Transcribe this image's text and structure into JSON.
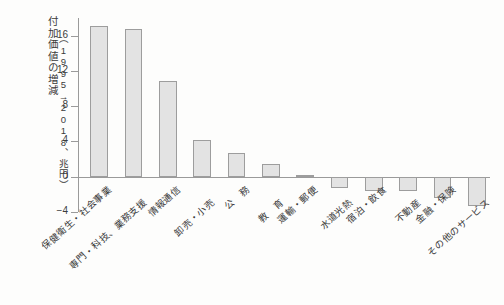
{
  "chart_data": {
    "type": "bar",
    "title": "",
    "subtitle": "",
    "xlabel": "",
    "ylabel": "付加価値の増減",
    "ylabel_sub": "（1995→2018、兆円）",
    "categories": [
      "保健衛生・社会事業",
      "専門・科技、業務支援",
      "情報通信",
      "卸売・小売",
      "公　務",
      "教　育",
      "運輸・郵便",
      "水道光熱",
      "宿泊・飲食",
      "不動産",
      "金融・保険",
      "その他のサービス"
    ],
    "values": [
      17.1,
      16.8,
      10.8,
      4.2,
      2.7,
      1.4,
      0.2,
      -1.3,
      -1.6,
      -1.6,
      -2.4,
      -3.3
    ],
    "units": "兆円",
    "ylim": [
      -4,
      18
    ],
    "yticks": [
      16,
      12,
      8,
      4,
      0,
      -4
    ],
    "ytick_labels": [
      "16",
      "12",
      "8",
      "4",
      "0",
      "−4"
    ],
    "grid": false,
    "legend": null,
    "bar_fill": "#e3e3e3",
    "bar_edge": "#9d9d9d",
    "axis_color": "#9a9a9a"
  }
}
